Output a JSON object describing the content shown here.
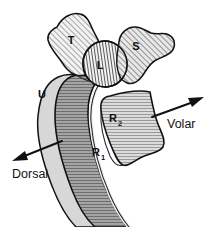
{
  "figure": {
    "background_color": "#ffffff",
    "outline_color": "#111111",
    "width": 216,
    "height": 227
  },
  "bones": [
    {
      "id": "triquetrum",
      "label": "T",
      "hatch": "diagonal-forward",
      "fill_color": "#e8e8e8",
      "label_x": 71,
      "label_y": 44
    },
    {
      "id": "lunate",
      "label": "L",
      "hatch": "vertical",
      "fill_color": "#ededed",
      "label_x": 100,
      "label_y": 69
    },
    {
      "id": "scaphoid",
      "label": "S",
      "hatch": "diagonal-forward",
      "fill_color": "#e3e3e3",
      "label_x": 136,
      "label_y": 50
    },
    {
      "id": "ulna",
      "label": "U",
      "hatch": "none",
      "fill_color": "#d9d9d9",
      "label_x": 42,
      "label_y": 98
    },
    {
      "id": "radius-distal-volar",
      "label": "R",
      "sublabel": "2",
      "hatch": "horizontal",
      "fill_color": "#cfcfcf",
      "label_x": 116,
      "label_y": 122
    },
    {
      "id": "radius-dorsal-shaft",
      "label": "R",
      "sublabel": "1",
      "hatch": "horizontal",
      "fill_color": "#a8a8a8",
      "label_x": 98,
      "label_y": 156
    }
  ],
  "direction_markers": [
    {
      "id": "volar",
      "label": "Volar",
      "label_x": 167,
      "label_y": 127,
      "arrow_from": [
        152,
        117
      ],
      "arrow_to": [
        202,
        99
      ]
    },
    {
      "id": "dorsal",
      "label": "Dorsal",
      "label_x": 11,
      "label_y": 175,
      "arrow_from": [
        62,
        141
      ],
      "arrow_to": [
        13,
        160
      ]
    }
  ]
}
